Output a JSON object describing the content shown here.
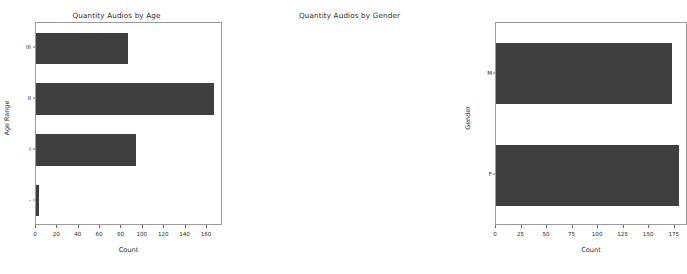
{
  "figure": {
    "background_color": "#ffffff",
    "bar_color": "#3f3f3f",
    "axis_color": "#9a9a9a"
  },
  "chart_data": [
    {
      "type": "bar",
      "orientation": "horizontal",
      "title": "Quantity Audios by Age",
      "xlabel": "Count",
      "ylabel": "Age Range",
      "categories": [
        "III",
        "II",
        "I",
        "-"
      ],
      "values": [
        86,
        167,
        94,
        3
      ],
      "xlim": [
        0,
        175
      ],
      "ylim": [
        -0.5,
        3.5
      ],
      "xticks": [
        0,
        20,
        40,
        60,
        80,
        100,
        120,
        140,
        160
      ],
      "xticklabels": [
        "0",
        "20",
        "40",
        "60",
        "80",
        "100",
        "120",
        "140",
        "160"
      ],
      "yticklabels": [
        "III",
        "II",
        "I",
        "-"
      ],
      "grid": false,
      "legend": false
    },
    {
      "type": "bar",
      "orientation": "horizontal",
      "title": "Quantity Audios by Gender",
      "xlabel": "Count",
      "ylabel": "Gender",
      "categories": [
        "M",
        "F"
      ],
      "values": [
        172,
        179
      ],
      "xlim": [
        0,
        188
      ],
      "ylim": [
        -0.5,
        1.5
      ],
      "xticks": [
        0,
        25,
        50,
        75,
        100,
        125,
        150,
        175
      ],
      "xticklabels": [
        "0",
        "25",
        "50",
        "75",
        "100",
        "125",
        "150",
        "175"
      ],
      "yticklabels": [
        "M",
        "F"
      ],
      "grid": false,
      "legend": false
    }
  ]
}
